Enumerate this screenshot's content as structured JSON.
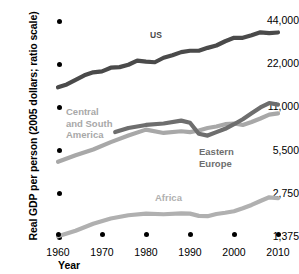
{
  "chart_data": {
    "type": "line",
    "title": "",
    "xlabel": "Year",
    "ylabel": "Real GDP per person (2005 dollars; ratio scale)",
    "scale": "log",
    "grid": false,
    "legend_position": "inline-labels",
    "x_ticks": [
      1960,
      1970,
      1980,
      1990,
      2000,
      2010
    ],
    "x_tick_labels": [
      "1960",
      "1970",
      "1980",
      "1990",
      "2000",
      "2010"
    ],
    "y_ticks": [
      1375,
      2750,
      5500,
      11000,
      22000,
      44000
    ],
    "y_tick_labels": [
      "1,375",
      "2,750",
      "5,500",
      "11,000",
      "22,000",
      "44,000"
    ],
    "xlim": [
      1960,
      2011
    ],
    "ylim": [
      1375,
      44000
    ],
    "series": [
      {
        "name": "US",
        "color": "#4a4a4a",
        "label_text": "US",
        "x": [
          1960,
          1962,
          1964,
          1966,
          1968,
          1970,
          1972,
          1974,
          1976,
          1978,
          1980,
          1982,
          1984,
          1986,
          1988,
          1990,
          1992,
          1994,
          1996,
          1998,
          2000,
          2002,
          2004,
          2006,
          2008,
          2010
        ],
        "values": [
          15200,
          15900,
          17100,
          18400,
          19300,
          19600,
          20800,
          21000,
          21800,
          23300,
          22900,
          22700,
          24400,
          25400,
          26700,
          27300,
          27300,
          28600,
          29700,
          31800,
          33600,
          33600,
          35000,
          36700,
          36200,
          36600
        ]
      },
      {
        "name": "Central and South America",
        "color": "#a8a8a8",
        "label_text": "Central\nand South\nAmerica",
        "x": [
          1960,
          1964,
          1968,
          1972,
          1976,
          1980,
          1984,
          1988,
          1990,
          1992,
          1994,
          1996,
          1998,
          2000,
          2002,
          2004,
          2006,
          2008,
          2010
        ],
        "values": [
          4600,
          5100,
          5600,
          6300,
          7000,
          7700,
          7300,
          7500,
          7400,
          7600,
          7900,
          8100,
          8400,
          8500,
          8300,
          8700,
          9200,
          9800,
          10000
        ]
      },
      {
        "name": "Eastern Europe",
        "color": "#6e6e6e",
        "label_text": "Eastern\nEurope",
        "x": [
          1973,
          1976,
          1980,
          1984,
          1988,
          1990,
          1992,
          1994,
          1996,
          1998,
          2000,
          2002,
          2004,
          2006,
          2008,
          2010
        ],
        "values": [
          7400,
          7900,
          8300,
          8500,
          8900,
          8600,
          7200,
          7000,
          7400,
          7800,
          8400,
          9100,
          10000,
          11000,
          11800,
          11500
        ]
      },
      {
        "name": "Africa",
        "color": "#b0b0b0",
        "label_text": "Africa",
        "x": [
          1960,
          1964,
          1968,
          1972,
          1976,
          1980,
          1984,
          1988,
          1990,
          1992,
          1994,
          1996,
          1998,
          2000,
          2002,
          2004,
          2006,
          2008,
          2010
        ],
        "values": [
          1390,
          1520,
          1700,
          1850,
          1950,
          2000,
          1980,
          2010,
          2000,
          1930,
          1920,
          1990,
          2030,
          2080,
          2180,
          2300,
          2450,
          2600,
          2560
        ]
      }
    ]
  }
}
